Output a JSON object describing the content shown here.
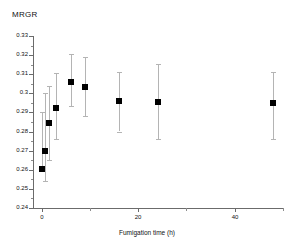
{
  "chart_data": {
    "type": "scatter",
    "title": "",
    "ylabel": "MRGR",
    "xlabel": "Fumigation time (h)",
    "grid": false,
    "legend": false,
    "xlim": [
      -1.8,
      50
    ],
    "ylim": [
      0.24,
      0.33
    ],
    "yticks": [
      0.24,
      0.25,
      0.26,
      0.27,
      0.28,
      0.29,
      0.3,
      0.31,
      0.32,
      0.33
    ],
    "ytick_labels": [
      "0.24",
      "0.25",
      "0.26",
      "0.27",
      "0.28",
      "0.29",
      "0.3",
      "0.31",
      "0.32",
      "0.33"
    ],
    "xticks": [
      0,
      20,
      40
    ],
    "xtick_labels": [
      "0",
      "20",
      "40"
    ],
    "xticks_minor": [
      10,
      30,
      50
    ],
    "marker": "filled-square",
    "marker_color": "#000000",
    "errorbar_color": "#b4b4b4",
    "axis_color": "#6b6b6b",
    "points": [
      {
        "x": 0,
        "y": 0.2605,
        "err_low": 0.2605,
        "err_high": 0.29,
        "label": "t=0"
      },
      {
        "x": 0.6,
        "y": 0.27,
        "err_low": 0.254,
        "err_high": 0.3,
        "label": "t=0.6"
      },
      {
        "x": 1.5,
        "y": 0.2845,
        "err_low": 0.265,
        "err_high": 0.304,
        "label": "t=1.5"
      },
      {
        "x": 3,
        "y": 0.2925,
        "err_low": 0.276,
        "err_high": 0.3105,
        "label": "t=3"
      },
      {
        "x": 6,
        "y": 0.306,
        "err_low": 0.2935,
        "err_high": 0.3205,
        "label": "t=6"
      },
      {
        "x": 9,
        "y": 0.3035,
        "err_low": 0.288,
        "err_high": 0.319,
        "label": "t=9"
      },
      {
        "x": 16,
        "y": 0.296,
        "err_low": 0.28,
        "err_high": 0.311,
        "label": "t=16"
      },
      {
        "x": 24,
        "y": 0.2955,
        "err_low": 0.276,
        "err_high": 0.3155,
        "label": "t=24"
      },
      {
        "x": 48,
        "y": 0.295,
        "err_low": 0.276,
        "err_high": 0.311,
        "label": "t=48"
      }
    ]
  }
}
